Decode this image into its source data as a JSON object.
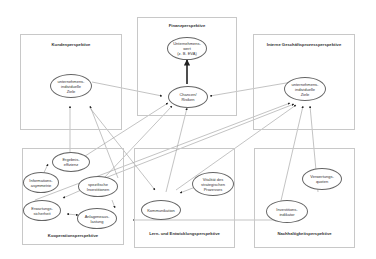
{
  "perspectives": {
    "kunden": "Kundenperspektive",
    "finanz": "Finanzperspektive",
    "intern": "Interne Geschäftsprozessperspektive",
    "kooperation": "Kooperationsperspektive",
    "lern": "Lern- und Entwicklungsperspektive",
    "nachhaltigkeit": "Nachhaltigkeitsperspektive"
  },
  "nodes": {
    "unternehmenswert": "Unternehmens-\nwert\n(z. B. EVA)",
    "chancen": "Chancen/\nRisiken",
    "kunden_ziele": "unternehmens-\nindividuelle\nZiele",
    "intern_ziele": "unternehmens-\nindividuelle\nZiele",
    "ergebnis": "Ergebnis-\neffizienz",
    "info": "Informations-\nasymmetrie",
    "spezifisch": "spezifische\nInvestitionen",
    "erwartung": "Erwartungs-\nsicherheit",
    "anlage": "Anlageneaus-\nlastung",
    "kommunikation": "Kommunikation",
    "vitalitaet": "Vitalität des\nstrategischen\nProzesses",
    "verwertung": "Verwertungs-\nquoten",
    "investitions": "Investitions-\nindikator"
  },
  "colors": {
    "line": "#999999",
    "border": "#c8c8c8",
    "text": "#333333"
  }
}
